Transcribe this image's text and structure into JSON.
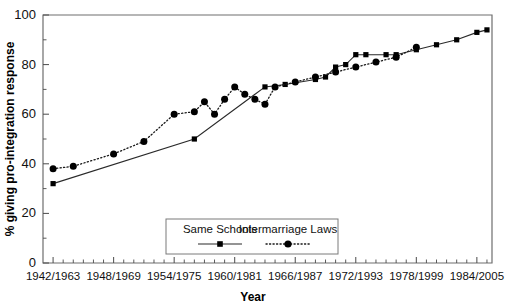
{
  "chart_data": {
    "type": "line",
    "title": "",
    "xlabel": "Year",
    "ylabel": "% giving pro-integration response",
    "ylim": [
      0,
      100
    ],
    "yticks": [
      0,
      20,
      40,
      60,
      80,
      100
    ],
    "ytick_labels": [
      "0",
      "20",
      "40",
      "60",
      "80",
      "100"
    ],
    "grid": false,
    "legend_position": "inside-bottom-center",
    "xtick_labels": [
      "1942/1963",
      "1948/1969",
      "1954/1975",
      "1960/1981",
      "1966/1987",
      "1972/1993",
      "1978/1999",
      "1984/2005"
    ],
    "xtick_values": [
      1942,
      1948,
      1954,
      1960,
      1966,
      1972,
      1978,
      1984
    ],
    "x_minor_step": 1,
    "xlim": [
      1941,
      1985.5
    ],
    "series": [
      {
        "name": "Same Schools",
        "style": "solid",
        "marker": "square",
        "x": [
          1942,
          1956,
          1963,
          1965,
          1968,
          1969,
          1970,
          1971,
          1972,
          1973,
          1975,
          1976,
          1978,
          1980,
          1982,
          1984,
          1985
        ],
        "values": [
          32,
          50,
          71,
          72,
          74,
          75,
          79,
          80,
          84,
          84,
          84,
          84,
          86,
          88,
          90,
          93,
          94
        ]
      },
      {
        "name": "Intermarriage Laws",
        "style": "dotted",
        "marker": "circle",
        "x": [
          1942,
          1944,
          1948,
          1951,
          1954,
          1956,
          1957,
          1958,
          1959,
          1960,
          1961,
          1962,
          1963,
          1964,
          1966,
          1968,
          1970,
          1972,
          1974,
          1976,
          1978
        ],
        "values": [
          38,
          39,
          44,
          49,
          60,
          61,
          65,
          60,
          66,
          71,
          68,
          66,
          64,
          71,
          73,
          75,
          77,
          79,
          81,
          83,
          87
        ]
      }
    ],
    "legend_entries": [
      {
        "label": "Same Schools",
        "style": "solid",
        "marker": "square"
      },
      {
        "label": "Intermarriage Laws",
        "style": "dotted",
        "marker": "circle"
      }
    ]
  }
}
